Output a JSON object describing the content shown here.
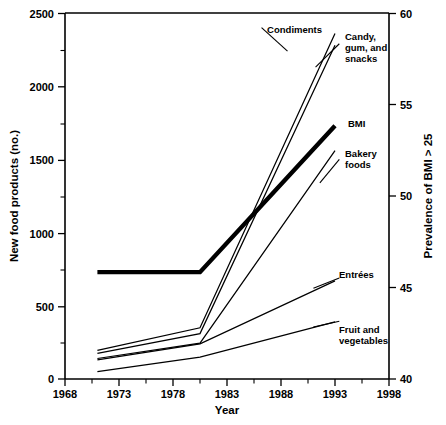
{
  "chart_data": {
    "type": "line",
    "title": "",
    "xlabel": "Year",
    "ylabel": "New food products (no.)",
    "y2label": "Prevalence of BMI > 25",
    "xlim": [
      1968,
      1998
    ],
    "ylim": [
      0,
      2500
    ],
    "y2lim": [
      40,
      60
    ],
    "xticks": [
      1968,
      1973,
      1978,
      1983,
      1988,
      1993,
      1998
    ],
    "xticklabels": [
      "1968",
      "1973",
      "1978",
      "1983",
      "1988",
      "1993",
      "1998"
    ],
    "xminorticks": [
      1970.5,
      1975.5,
      1980.5,
      1985.5,
      1990.5,
      1995.5
    ],
    "yticks": [
      0,
      500,
      1000,
      1500,
      2000,
      2500
    ],
    "yticklabels": [
      "0",
      "500",
      "1000",
      "1500",
      "2000",
      "2500"
    ],
    "yminorticks": [
      250,
      750,
      1250,
      1750,
      2250
    ],
    "y2ticks": [
      40,
      45,
      50,
      55,
      60
    ],
    "y2ticklabels": [
      "40",
      "45",
      "50",
      "55",
      "60"
    ],
    "grid": false,
    "legend": "inline-annotations",
    "series": [
      {
        "name": "Condiments",
        "axis": "left",
        "bold": false,
        "x": [
          1971,
          1980.5,
          1993
        ],
        "values": [
          195,
          350,
          2360
        ],
        "label_x": 1985.0,
        "label_y": 2420,
        "label_anchor": "end",
        "leader": [
          [
            1986.2,
            2400
          ],
          [
            1988.6,
            2240
          ]
        ]
      },
      {
        "name": "Candy, gum, and snacks",
        "axis": "left",
        "bold": false,
        "x": [
          1971,
          1980.5,
          1993
        ],
        "values": [
          175,
          310,
          2280
        ],
        "label_lines": [
          "Candy,",
          "gum, and",
          "snacks"
        ],
        "label_x": 1993.9,
        "label_y": 2330,
        "label_anchor": "start",
        "leader": [
          [
            1993.4,
            2290
          ],
          [
            1991.2,
            2130
          ]
        ]
      },
      {
        "name": "BMI",
        "axis": "right",
        "bold": true,
        "x": [
          1971,
          1980.5,
          1993
        ],
        "values": [
          730,
          730,
          1730
        ],
        "y2_values": [
          45.8,
          45.8,
          53.8
        ],
        "label_x": 1993.9,
        "label_y": 1760,
        "label_anchor": "start",
        "leader": null
      },
      {
        "name": "Bakery foods",
        "axis": "left",
        "bold": false,
        "x": [
          1971,
          1980.5,
          1993
        ],
        "values": [
          140,
          245,
          1560
        ],
        "label_lines": [
          "Bakery",
          "foods"
        ],
        "label_x": 1993.9,
        "label_y": 1600,
        "label_anchor": "start",
        "leader": [
          [
            1993.4,
            1500
          ],
          [
            1991.6,
            1340
          ]
        ]
      },
      {
        "name": "Entrées",
        "axis": "left",
        "bold": false,
        "x": [
          1971,
          1980.5,
          1993
        ],
        "values": [
          130,
          240,
          670
        ],
        "label_x": 1993.9,
        "label_y": 730,
        "label_anchor": "start",
        "leader": [
          [
            1993.4,
            690
          ],
          [
            1991.0,
            620
          ]
        ]
      },
      {
        "name": "Fruit and vegetables",
        "axis": "left",
        "bold": false,
        "x": [
          1971,
          1980.5,
          1993
        ],
        "values": [
          50,
          150,
          390
        ],
        "label_lines": [
          "Fruit and",
          "vegetables"
        ],
        "label_x": 1993.9,
        "label_y": 420,
        "label_anchor": "start",
        "leader": [
          [
            1993.4,
            395
          ],
          [
            1991.0,
            355
          ]
        ]
      }
    ]
  },
  "axes": {
    "left_title": "New food products (no.)",
    "right_title": "Prevalence of BMI > 25",
    "bottom_title": "Year"
  },
  "labels": {
    "condiments": "Condiments",
    "candy_1": "Candy,",
    "candy_2": "gum, and",
    "candy_3": "snacks",
    "bmi": "BMI",
    "bakery_1": "Bakery",
    "bakery_2": "foods",
    "entrees": "Entrées",
    "fruit_1": "Fruit and",
    "fruit_2": "vegetables"
  },
  "yticks": {
    "t0": "0",
    "t1": "500",
    "t2": "1000",
    "t3": "1500",
    "t4": "2000",
    "t5": "2500"
  },
  "y2ticks": {
    "t0": "40",
    "t1": "45",
    "t2": "50",
    "t3": "55",
    "t4": "60"
  },
  "xticks": {
    "t0": "1968",
    "t1": "1973",
    "t2": "1978",
    "t3": "1983",
    "t4": "1988",
    "t5": "1993",
    "t6": "1998"
  },
  "colors": {
    "line": "#000000",
    "background": "#ffffff",
    "text": "#000000"
  }
}
